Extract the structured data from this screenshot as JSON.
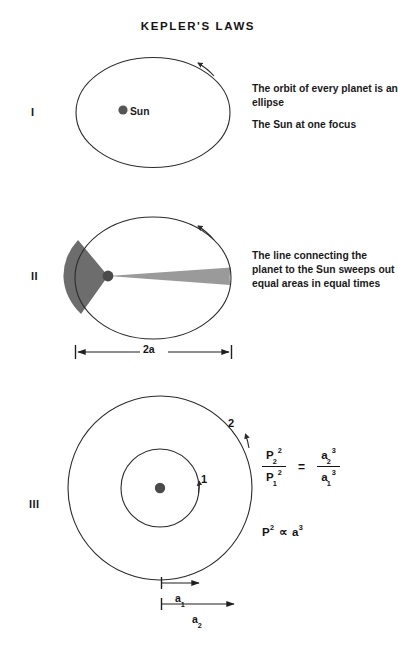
{
  "title": "KEPLER'S LAWS",
  "laws": [
    {
      "numeral": "I",
      "lines": [
        "The orbit of every planet is an ellipse",
        "The Sun at one focus"
      ],
      "sun_label": "Sun",
      "diagram": {
        "kind": "ellipse-with-focus",
        "ellipse": {
          "cx": 153,
          "cy": 112.5,
          "rx": 77,
          "ry": 55
        },
        "focus": {
          "cx": 123,
          "cy": 110,
          "r": 4.6
        },
        "direction_arrow": "counterclockwise"
      }
    },
    {
      "numeral": "II",
      "lines": [
        "The line connecting the planet to the Sun sweeps out equal areas in equal times"
      ],
      "diagram": {
        "kind": "ellipse-equal-areas",
        "ellipse": {
          "cx": 153,
          "cy": 278,
          "rx": 78,
          "ry": 61
        },
        "focus": {
          "cx": 108,
          "cy": 276,
          "r": 5.4
        },
        "sector_near_color": "#6d6d6d",
        "sector_far_color": "#9a9a9a",
        "direction_arrow": "counterclockwise"
      },
      "dimension": {
        "label": "2a",
        "x1": 75,
        "x2": 232,
        "y": 352
      }
    },
    {
      "numeral": "III",
      "diagram": {
        "kind": "two-concentric-orbits",
        "center": {
          "cx": 160,
          "cy": 488
        },
        "inner_radius": 39,
        "outer_radius": 92,
        "sun": {
          "r": 5.2
        },
        "inner_label": "1",
        "outer_label": "2"
      },
      "dimensions": [
        {
          "label": "a",
          "subscript": "1",
          "x1": 161,
          "x2": 201,
          "y": 583
        },
        {
          "label": "a",
          "subscript": "2",
          "x1": 161,
          "x2": 236,
          "y": 604
        }
      ],
      "formula": {
        "num_left": "P",
        "num_left_sub": "2",
        "num_left_sup": "2",
        "den_left": "P",
        "den_left_sub": "1",
        "den_left_sup": "2",
        "equals": "=",
        "num_right": "a",
        "num_right_sub": "2",
        "num_right_sup": "3",
        "den_right": "a",
        "den_right_sub": "1",
        "den_right_sup": "3",
        "proportional": "P",
        "proportional_sup": "2",
        "proportional_symbol": "∝",
        "proportional_rhs": "a",
        "proportional_rhs_sup": "3"
      }
    }
  ],
  "colors": {
    "stroke": "#2b2b2b",
    "text": "#1a1a1a",
    "sun": "#555555",
    "sector_near": "#6d6d6d",
    "sector_far": "#9a9a9a",
    "background": "#ffffff"
  }
}
